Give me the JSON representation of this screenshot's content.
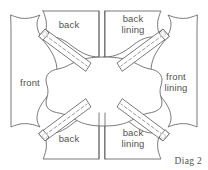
{
  "diagram": {
    "caption": "Diag 2",
    "title": "Diag 2",
    "stroke_color": "#6b6b6b",
    "fill_color": "#ffffff",
    "text_color": "#55514f",
    "background": "#ffffff",
    "pieces": [
      {
        "id": "back-top",
        "label": "back",
        "position": "top-left"
      },
      {
        "id": "back-lining-top",
        "label": "back\nlining",
        "position": "top-right"
      },
      {
        "id": "front",
        "label": "front",
        "position": "left"
      },
      {
        "id": "front-lining",
        "label": "front\nlining",
        "position": "right"
      },
      {
        "id": "back-bottom",
        "label": "back",
        "position": "bottom-left"
      },
      {
        "id": "back-lining-bottom",
        "label": "back\nlining",
        "position": "bottom-right"
      }
    ],
    "straps": [
      {
        "id": "strap-top-left",
        "style": "dashed-centerline"
      },
      {
        "id": "strap-top-right",
        "style": "dashed-centerline"
      },
      {
        "id": "strap-bottom-left",
        "style": "dashed-centerline"
      },
      {
        "id": "strap-bottom-right",
        "style": "dashed-centerline"
      }
    ],
    "center_piece": {
      "id": "center-yoke",
      "label": ""
    }
  }
}
